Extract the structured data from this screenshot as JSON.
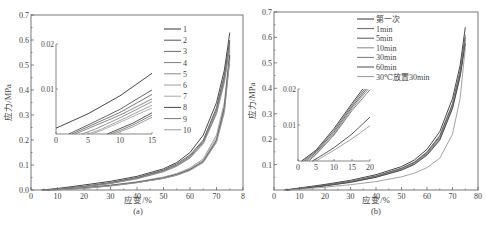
{
  "chart_data": [
    {
      "id": "a",
      "type": "line",
      "caption": "(a)",
      "xlabel": "应变/%",
      "ylabel": "应力/MPa",
      "xlim": [
        0,
        80
      ],
      "ylim": [
        0,
        0.7
      ],
      "xticks": [
        0,
        10,
        20,
        30,
        40,
        50,
        60,
        70,
        80
      ],
      "xtick_labels": [
        "0",
        "10",
        "20",
        "30",
        "40",
        "50",
        "60",
        "70",
        "8"
      ],
      "yticks": [
        0.0,
        0.1,
        0.2,
        0.3,
        0.4,
        0.5,
        0.6,
        0.7
      ],
      "ytick_labels": [
        "0.0",
        "0.1",
        "0.2",
        "0.3",
        "0.4",
        "0.5",
        "0.6",
        "0.7"
      ],
      "legend": [
        "1",
        "2",
        "3",
        "4",
        "5",
        "6",
        "7",
        "8",
        "9",
        "10"
      ],
      "legend_position": "top-right",
      "series": [
        {
          "name": "1",
          "x": [
            4,
            10,
            20,
            30,
            40,
            50,
            55,
            60,
            65,
            70,
            73,
            75
          ],
          "y": [
            0,
            0.006,
            0.02,
            0.035,
            0.055,
            0.085,
            0.11,
            0.15,
            0.22,
            0.35,
            0.48,
            0.63
          ]
        },
        {
          "name": "2",
          "x": [
            5,
            10,
            20,
            30,
            40,
            50,
            55,
            60,
            65,
            70,
            73,
            75
          ],
          "y": [
            0,
            0.004,
            0.015,
            0.03,
            0.05,
            0.08,
            0.105,
            0.14,
            0.2,
            0.33,
            0.46,
            0.6
          ]
        },
        {
          "name": "3",
          "x": [
            5,
            10,
            20,
            30,
            40,
            50,
            55,
            60,
            65,
            70,
            73,
            75
          ],
          "y": [
            0,
            0.004,
            0.014,
            0.028,
            0.048,
            0.078,
            0.1,
            0.135,
            0.195,
            0.32,
            0.45,
            0.59
          ]
        },
        {
          "name": "4",
          "x": [
            5,
            10,
            20,
            30,
            40,
            50,
            55,
            60,
            65,
            70,
            73,
            75
          ],
          "y": [
            0,
            0.003,
            0.013,
            0.027,
            0.046,
            0.075,
            0.098,
            0.13,
            0.19,
            0.31,
            0.44,
            0.58
          ]
        },
        {
          "name": "5",
          "x": [
            5,
            10,
            20,
            30,
            40,
            50,
            55,
            60,
            65,
            70,
            73,
            75
          ],
          "y": [
            0,
            0.003,
            0.012,
            0.026,
            0.045,
            0.073,
            0.095,
            0.128,
            0.185,
            0.305,
            0.43,
            0.57
          ]
        },
        {
          "name": "6",
          "x": [
            6,
            10,
            20,
            30,
            40,
            50,
            55,
            60,
            65,
            70,
            73,
            75
          ],
          "y": [
            0,
            0.002,
            0.01,
            0.02,
            0.033,
            0.052,
            0.066,
            0.088,
            0.125,
            0.22,
            0.35,
            0.56
          ]
        },
        {
          "name": "7",
          "x": [
            6,
            10,
            20,
            30,
            40,
            50,
            55,
            60,
            65,
            70,
            73,
            75
          ],
          "y": [
            0,
            0.002,
            0.009,
            0.019,
            0.032,
            0.05,
            0.064,
            0.085,
            0.12,
            0.21,
            0.34,
            0.55
          ]
        },
        {
          "name": "8",
          "x": [
            6,
            10,
            20,
            30,
            40,
            50,
            55,
            60,
            65,
            70,
            73,
            75
          ],
          "y": [
            0,
            0.002,
            0.008,
            0.018,
            0.031,
            0.048,
            0.062,
            0.082,
            0.115,
            0.2,
            0.33,
            0.54
          ]
        },
        {
          "name": "9",
          "x": [
            7,
            10,
            20,
            30,
            40,
            50,
            55,
            60,
            65,
            70,
            73,
            75
          ],
          "y": [
            0,
            0.001,
            0.007,
            0.017,
            0.03,
            0.047,
            0.06,
            0.08,
            0.112,
            0.195,
            0.32,
            0.53
          ]
        },
        {
          "name": "10",
          "x": [
            7,
            10,
            20,
            30,
            40,
            50,
            55,
            60,
            65,
            70,
            73,
            75
          ],
          "y": [
            0,
            0.001,
            0.007,
            0.016,
            0.029,
            0.046,
            0.059,
            0.078,
            0.11,
            0.19,
            0.31,
            0.52
          ]
        }
      ],
      "inset": {
        "xlim": [
          0,
          15
        ],
        "ylim": [
          0,
          0.02
        ],
        "xticks": [
          0,
          5,
          10,
          15
        ],
        "yticks": [
          0.01,
          0.02
        ],
        "ytick_labels": [
          "0.01",
          "0.02"
        ],
        "series": [
          {
            "name": "1",
            "x": [
              0,
              5,
              10,
              15
            ],
            "y": [
              0.0013,
              0.0045,
              0.0085,
              0.0135
            ]
          },
          {
            "name": "2",
            "x": [
              2,
              5,
              10,
              15
            ],
            "y": [
              0,
              0.002,
              0.0055,
              0.0098
            ]
          },
          {
            "name": "3",
            "x": [
              2.5,
              5,
              10,
              15
            ],
            "y": [
              0,
              0.0016,
              0.0048,
              0.0088
            ]
          },
          {
            "name": "4",
            "x": [
              3,
              5,
              10,
              15
            ],
            "y": [
              0,
              0.0012,
              0.0042,
              0.0078
            ]
          },
          {
            "name": "5",
            "x": [
              4,
              6,
              10,
              15
            ],
            "y": [
              0,
              0.001,
              0.0036,
              0.0072
            ]
          },
          {
            "name": "6",
            "x": [
              5,
              7,
              10,
              15
            ],
            "y": [
              0,
              0.001,
              0.003,
              0.0064
            ]
          },
          {
            "name": "7",
            "x": [
              5.5,
              7,
              10,
              15
            ],
            "y": [
              0,
              0.0007,
              0.0026,
              0.0058
            ]
          },
          {
            "name": "8",
            "x": [
              8,
              10,
              12,
              15
            ],
            "y": [
              0,
              0.0012,
              0.0024,
              0.0047
            ]
          },
          {
            "name": "9",
            "x": [
              8.5,
              10,
              12,
              15
            ],
            "y": [
              0,
              0.0008,
              0.002,
              0.0042
            ]
          },
          {
            "name": "10",
            "x": [
              9,
              10,
              12,
              15
            ],
            "y": [
              0,
              0.0005,
              0.0016,
              0.0037
            ]
          }
        ]
      }
    },
    {
      "id": "b",
      "type": "line",
      "caption": "(b)",
      "xlabel": "应变/%",
      "ylabel": "应力/MPa",
      "xlim": [
        0,
        80
      ],
      "ylim": [
        0,
        0.7
      ],
      "xticks": [
        0,
        10,
        20,
        30,
        40,
        50,
        60,
        70,
        80
      ],
      "xtick_labels": [
        "0",
        "10",
        "20",
        "30",
        "40",
        "50",
        "60",
        "70",
        "80"
      ],
      "yticks": [
        0.1,
        0.2,
        0.3,
        0.4,
        0.5,
        0.6,
        0.7
      ],
      "ytick_labels": [
        "0.1",
        "0.2",
        "0.3",
        "0.4",
        "0.5",
        "0.6",
        "0.7"
      ],
      "legend": [
        "第一次",
        "1min",
        "5min",
        "10min",
        "30min",
        "60min",
        "30℃放置30min"
      ],
      "legend_position": "top-center",
      "series": [
        {
          "name": "第一次",
          "x": [
            4,
            10,
            20,
            30,
            40,
            50,
            55,
            60,
            65,
            70,
            73,
            75
          ],
          "y": [
            0,
            0.008,
            0.022,
            0.038,
            0.06,
            0.092,
            0.118,
            0.16,
            0.23,
            0.36,
            0.49,
            0.64
          ]
        },
        {
          "name": "1min",
          "x": [
            5,
            10,
            20,
            30,
            40,
            50,
            55,
            60,
            65,
            70,
            73,
            75
          ],
          "y": [
            0,
            0.006,
            0.019,
            0.034,
            0.055,
            0.086,
            0.11,
            0.15,
            0.215,
            0.34,
            0.47,
            0.61
          ]
        },
        {
          "name": "5min",
          "x": [
            5,
            10,
            20,
            30,
            40,
            50,
            55,
            60,
            65,
            70,
            73,
            75
          ],
          "y": [
            0,
            0.006,
            0.018,
            0.033,
            0.054,
            0.084,
            0.108,
            0.147,
            0.21,
            0.335,
            0.46,
            0.6
          ]
        },
        {
          "name": "10min",
          "x": [
            5,
            10,
            20,
            30,
            40,
            50,
            55,
            60,
            65,
            70,
            73,
            75
          ],
          "y": [
            0,
            0.005,
            0.017,
            0.032,
            0.052,
            0.082,
            0.105,
            0.143,
            0.205,
            0.33,
            0.455,
            0.59
          ]
        },
        {
          "name": "30min",
          "x": [
            5,
            10,
            20,
            30,
            40,
            50,
            55,
            60,
            65,
            70,
            73,
            75
          ],
          "y": [
            0,
            0.005,
            0.017,
            0.031,
            0.051,
            0.08,
            0.103,
            0.14,
            0.2,
            0.325,
            0.45,
            0.58
          ]
        },
        {
          "name": "60min",
          "x": [
            5,
            10,
            20,
            30,
            40,
            50,
            55,
            60,
            65,
            70,
            73,
            75
          ],
          "y": [
            0,
            0.005,
            0.016,
            0.03,
            0.05,
            0.078,
            0.1,
            0.137,
            0.196,
            0.32,
            0.445,
            0.575
          ]
        },
        {
          "name": "30℃放置30min",
          "x": [
            6,
            10,
            20,
            30,
            40,
            50,
            55,
            60,
            65,
            70,
            73,
            75
          ],
          "y": [
            0,
            0.003,
            0.011,
            0.021,
            0.033,
            0.052,
            0.066,
            0.088,
            0.125,
            0.22,
            0.36,
            0.56
          ]
        }
      ],
      "inset": {
        "xlim": [
          0,
          20
        ],
        "ylim": [
          0,
          0.02
        ],
        "xticks": [
          0,
          5,
          10,
          15,
          20
        ],
        "yticks": [
          0.01,
          0.02
        ],
        "ytick_labels": [
          "0.01",
          "0.02"
        ],
        "series": [
          {
            "name": "第一次",
            "x": [
              1,
              5,
              10,
              15,
              18
            ],
            "y": [
              0,
              0.003,
              0.009,
              0.016,
              0.02
            ]
          },
          {
            "name": "1min",
            "x": [
              1.5,
              5,
              10,
              15,
              18.5
            ],
            "y": [
              0,
              0.0027,
              0.0085,
              0.0155,
              0.02
            ]
          },
          {
            "name": "5min",
            "x": [
              2,
              5,
              10,
              15,
              19
            ],
            "y": [
              0,
              0.0024,
              0.008,
              0.015,
              0.02
            ]
          },
          {
            "name": "10min",
            "x": [
              2.5,
              5,
              10,
              15,
              19.5
            ],
            "y": [
              0,
              0.002,
              0.0075,
              0.0145,
              0.02
            ]
          },
          {
            "name": "30min",
            "x": [
              3,
              5,
              10,
              15,
              20
            ],
            "y": [
              0,
              0.0018,
              0.0072,
              0.014,
              0.0198
            ]
          },
          {
            "name": "60min",
            "x": [
              4,
              7,
              10,
              15,
              20
            ],
            "y": [
              0,
              0.0018,
              0.0037,
              0.0075,
              0.0122
            ]
          },
          {
            "name": "30℃放置30min",
            "x": [
              5,
              7,
              10,
              15,
              20
            ],
            "y": [
              0,
              0.0012,
              0.003,
              0.0062,
              0.0098
            ]
          }
        ]
      }
    }
  ],
  "colors": {
    "axis": "#555555",
    "text": "#444444",
    "series_a": [
      "#333333",
      "#555555",
      "#6a6a6a",
      "#7d7d7d",
      "#8a8a8a",
      "#9a9a9a",
      "#a8a8a8",
      "#444444",
      "#777777",
      "#999999"
    ],
    "series_b": [
      "#333333",
      "#666666",
      "#555555",
      "#888888",
      "#777777",
      "#4a4a4a",
      "#999999"
    ]
  }
}
